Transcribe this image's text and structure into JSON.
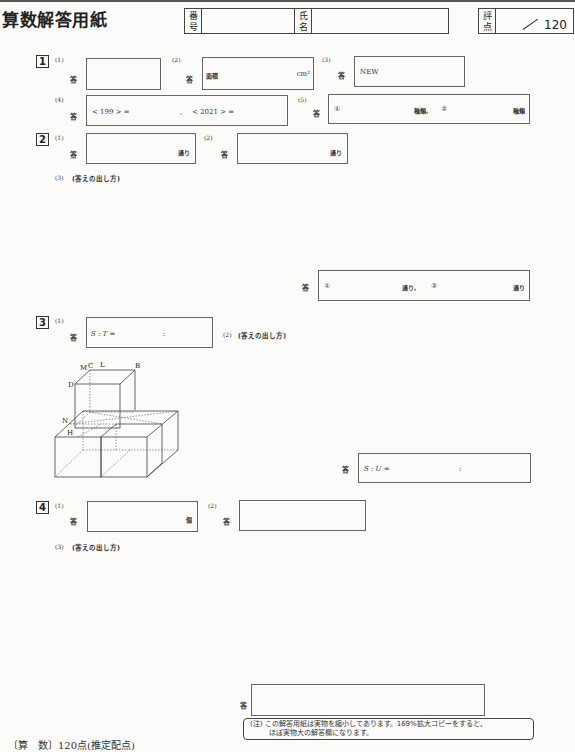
{
  "header": {
    "title": "算数解答用紙",
    "number_label": [
      "番",
      "号"
    ],
    "name_label": [
      "氏",
      "名"
    ],
    "score_label": [
      "評",
      "点"
    ],
    "score_total": "120"
  },
  "q1": {
    "num": "1",
    "p1": {
      "sub": "(1)",
      "ans": "答"
    },
    "p2": {
      "sub": "(2)",
      "ans": "答",
      "prefix": "面積",
      "unit": "cm²"
    },
    "p3": {
      "sub": "(3)",
      "ans": "答",
      "prefix": "NEW"
    },
    "p4": {
      "sub": "(4)",
      "ans": "答",
      "part_a": "< 199 > =",
      "sep": ",",
      "part_b": "< 2021 > ="
    },
    "p5": {
      "sub": "(5)",
      "ans": "答",
      "c1": "①",
      "unit1": "種類,",
      "c2": "②",
      "unit2": "種類"
    }
  },
  "q2": {
    "num": "2",
    "p1": {
      "sub": "(1)",
      "ans": "答",
      "unit": "通り"
    },
    "p2": {
      "sub": "(2)",
      "ans": "答",
      "unit": "通り"
    },
    "p3": {
      "sub": "(3)",
      "method": "(答えの出し方)",
      "ans": "答",
      "c1": "①",
      "unit1": "通り,",
      "c2": "②",
      "unit2": "通り"
    }
  },
  "q3": {
    "num": "3",
    "p1": {
      "sub": "(1)",
      "ans": "答",
      "prefix": "S : T =",
      "colon": ":"
    },
    "p2": {
      "sub": "(2)",
      "method": "(答えの出し方)",
      "ans": "答",
      "prefix": "S : U =",
      "colon": ":"
    },
    "figure_labels": {
      "M": "M",
      "C": "C",
      "L": "L",
      "B": "B",
      "D": "D",
      "N": "N",
      "H": "H"
    }
  },
  "q4": {
    "num": "4",
    "p1": {
      "sub": "(1)",
      "ans": "答",
      "unit": "個"
    },
    "p2": {
      "sub": "(2)",
      "ans": "答"
    },
    "p3": {
      "sub": "(3)",
      "method": "(答えの出し方)",
      "ans": "答"
    }
  },
  "footer": {
    "note_prefix": "(注)",
    "note_line1": "この解答用紙は実物を縮小してあります。169%拡大コピーをすると、",
    "note_line2": "ほぼ実物大の解答欄になります。",
    "scoring": "〔算　数〕120点(推定配点)"
  }
}
